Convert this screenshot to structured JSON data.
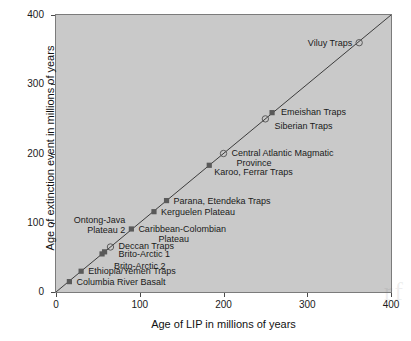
{
  "chart_data": {
    "type": "scatter",
    "title": "",
    "xlabel": "Age of LIP in millions of years",
    "ylabel": "Age of extinction event in millions of years",
    "xlim": [
      0,
      400
    ],
    "ylim": [
      0,
      400
    ],
    "xticks": [
      "0",
      "100",
      "200",
      "300",
      "400"
    ],
    "yticks": [
      "0",
      "100",
      "200",
      "300",
      "400"
    ],
    "grid": false,
    "legend": "none",
    "reference_line": {
      "description": "1:1 diagonal line",
      "from": [
        0,
        0
      ],
      "to": [
        400,
        400
      ]
    },
    "points": [
      {
        "label": "Columbia River Basalt",
        "x": 16,
        "y": 15,
        "marker": "filled-square",
        "label_pos": "right"
      },
      {
        "label": "Ethiopia/Yemen Traps",
        "x": 30,
        "y": 30,
        "marker": "filled-square",
        "label_pos": "right"
      },
      {
        "label": "Brito-Arctic 2",
        "x": 55,
        "y": 55,
        "marker": "filled-square",
        "label_pos": "right"
      },
      {
        "label": "Brito-Arctic 1",
        "x": 58,
        "y": 58,
        "marker": "filled-square",
        "label_pos": "right"
      },
      {
        "label": "Deccan Traps",
        "x": 65,
        "y": 65,
        "marker": "open-circle",
        "label_pos": "right"
      },
      {
        "label": "Ontong-Java\nPlateau 2",
        "x": 90,
        "y": 91,
        "marker": "filled-square",
        "label_pos": "left"
      },
      {
        "label": "Caribbean-Colombian\n        Plateau",
        "x": 90,
        "y": 91,
        "marker": "none",
        "label_pos": "right"
      },
      {
        "label": "Kerguelen Plateau",
        "x": 117,
        "y": 116,
        "marker": "filled-square",
        "label_pos": "right"
      },
      {
        "label": "Parana, Etendeka Traps",
        "x": 132,
        "y": 132,
        "marker": "filled-square",
        "label_pos": "right"
      },
      {
        "label": "Karoo, Ferrar Traps",
        "x": 183,
        "y": 183,
        "marker": "filled-square",
        "label_pos": "right"
      },
      {
        "label": "Central Atlantic Magmatic\n  Province",
        "x": 200,
        "y": 200,
        "marker": "open-circle",
        "label_pos": "right"
      },
      {
        "label": "Siberian Traps",
        "x": 250,
        "y": 250,
        "marker": "open-circle",
        "label_pos": "right"
      },
      {
        "label": "Emeishan Traps",
        "x": 258,
        "y": 259,
        "marker": "filled-square",
        "label_pos": "right"
      },
      {
        "label": "Viluy Traps",
        "x": 362,
        "y": 360,
        "marker": "open-circle",
        "label_pos": "left"
      }
    ],
    "colors": {
      "plot_background": "#c9c9c9",
      "figure_background": "#ffffff",
      "marker": "#5a5a5a",
      "line": "#3c3c3c",
      "text": "#1a1a1a",
      "frame": "#7b7b7b"
    }
  },
  "watermark": {
    "text": "rf"
  }
}
